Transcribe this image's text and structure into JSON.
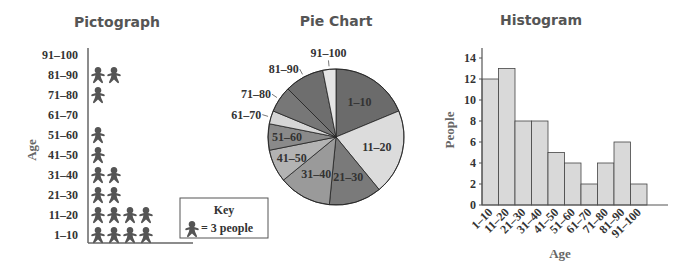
{
  "chart_data": [
    {
      "type": "pictograph",
      "title": "Pictograph",
      "ylabel": "Age",
      "categories": [
        "1–10",
        "11–20",
        "21–30",
        "31–40",
        "41–50",
        "51–60",
        "61–70",
        "71–80",
        "81–90",
        "91–100"
      ],
      "values": [
        12,
        13,
        8,
        8,
        5,
        4,
        2,
        4,
        6,
        2
      ],
      "icons": [
        4,
        4.33,
        2.67,
        2.67,
        1.67,
        1.33,
        0.67,
        1.33,
        2,
        0.67
      ],
      "key": {
        "title": "Key",
        "text": "= 3 people",
        "people_per_icon": 3
      },
      "icon_color": "#555555"
    },
    {
      "type": "pie",
      "title": "Pie Chart",
      "categories": [
        "1–10",
        "11–20",
        "21–30",
        "31–40",
        "41–50",
        "51–60",
        "61–70",
        "71–80",
        "81–90",
        "91–100"
      ],
      "values": [
        12,
        13,
        8,
        8,
        5,
        4,
        2,
        4,
        6,
        2
      ],
      "colors": [
        "#6b6b6b",
        "#dcdcdc",
        "#7a7a7a",
        "#9a9a9a",
        "#b3b3b3",
        "#8a8a8a",
        "#d6d6d6",
        "#777777",
        "#6e6e6e",
        "#e4e4e4"
      ]
    },
    {
      "type": "bar",
      "title": "Histogram",
      "xlabel": "Age",
      "ylabel": "People",
      "categories": [
        "1–10",
        "11–20",
        "21–30",
        "31–40",
        "41–50",
        "51–60",
        "61–70",
        "71–80",
        "81–90",
        "91–100"
      ],
      "values": [
        12,
        13,
        8,
        8,
        5,
        4,
        2,
        4,
        6,
        2
      ],
      "ylim": [
        0,
        14
      ],
      "yticks": [
        0,
        2,
        4,
        6,
        8,
        10,
        12,
        14
      ],
      "grid": false,
      "bar_color": "#d9d9d9"
    }
  ],
  "titles": {
    "pictograph": "Pictograph",
    "pie": "Pie Chart",
    "histogram": "Histogram"
  },
  "pictograph": {
    "ylabel": "Age",
    "key_title": "Key",
    "key_text": "= 3 people"
  },
  "histogram": {
    "xlabel": "Age",
    "ylabel": "People"
  }
}
